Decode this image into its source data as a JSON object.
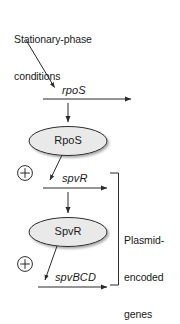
{
  "diagram": {
    "title": "Stationary-phase conditions",
    "title_lines": [
      "Stationary-phase",
      "conditions"
    ],
    "nodes": [
      {
        "id": "rpos-protein",
        "label": "RpoS",
        "shape": "ellipse",
        "fill": "#e9e9e9",
        "stroke": "#2b2b2b"
      },
      {
        "id": "spvr-protein",
        "label": "SpvR",
        "shape": "ellipse",
        "fill": "#e9e9e9",
        "stroke": "#2b2b2b"
      }
    ],
    "genes": [
      {
        "id": "rpos-gene",
        "label": "rpoS"
      },
      {
        "id": "spvr-gene",
        "label": "spvR"
      },
      {
        "id": "spvbcd-gene",
        "label": "spvBCD"
      }
    ],
    "activations": [
      {
        "id": "rpos-activates-spvr",
        "symbol": "⊕",
        "meaning": "plus"
      },
      {
        "id": "spvr-activates-spvbcd",
        "symbol": "⊕",
        "meaning": "plus"
      }
    ],
    "bracket": {
      "label": "Plasmid-encoded genes",
      "label_lines": [
        "Plasmid-",
        "encoded",
        "genes"
      ]
    },
    "colors": {
      "stroke": "#2b2b2b",
      "node_fill": "#e9e9e9",
      "text": "#1a1a1a",
      "background": "#ffffff"
    }
  }
}
